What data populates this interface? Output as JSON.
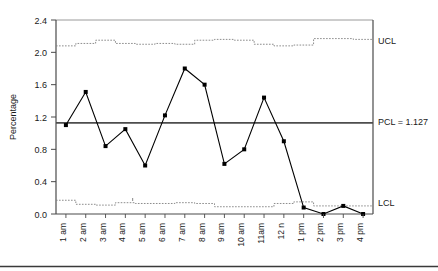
{
  "chart_data": {
    "type": "line",
    "title": "",
    "subtitle": "",
    "xlabel": "",
    "ylabel": "Percentage",
    "ylim": [
      0.0,
      2.4
    ],
    "yticks": [
      0.0,
      0.4,
      0.8,
      1.2,
      1.6,
      2.0,
      2.4
    ],
    "ytick_labels": [
      "0.0",
      "0.4",
      "0.8",
      "1.2",
      "1.6",
      "2.0",
      "2.4"
    ],
    "grid": false,
    "legend": "none",
    "categories": [
      "1 am",
      "2 am",
      "3 am",
      "4 am",
      "5 am",
      "6 am",
      "7 am",
      "8 am",
      "9 am",
      "10 am",
      "11am",
      "12 n",
      "1 pm",
      "2 pm",
      "3 pm",
      "4 pm"
    ],
    "series": [
      {
        "name": "Percentage",
        "marker": "filled-square",
        "color": "#000000",
        "values": [
          1.1,
          1.51,
          0.84,
          1.05,
          0.6,
          1.22,
          1.8,
          1.6,
          0.62,
          0.8,
          1.44,
          0.9,
          0.08,
          0.0,
          0.1,
          0.0
        ]
      },
      {
        "name": "UCL",
        "style": "dotted-step",
        "color": "#808080",
        "values": [
          2.08,
          2.11,
          2.15,
          2.11,
          2.1,
          2.11,
          2.1,
          2.15,
          2.16,
          2.15,
          2.1,
          2.08,
          2.09,
          2.17,
          2.17,
          2.16
        ]
      },
      {
        "name": "LCL",
        "style": "dotted-step",
        "color": "#808080",
        "values": [
          0.17,
          0.12,
          0.11,
          0.14,
          0.13,
          0.13,
          0.14,
          0.13,
          0.09,
          0.09,
          0.09,
          0.13,
          0.15,
          0.1,
          0.1,
          0.1
        ]
      },
      {
        "name": "PCL",
        "style": "solid-center",
        "color": "#4d4d4d",
        "value": 1.127
      }
    ],
    "annotations": [
      {
        "key": "ucl",
        "text": "UCL",
        "y": 2.1
      },
      {
        "key": "pcl",
        "text": "PCL = 1.127",
        "y": 1.127
      },
      {
        "key": "lcl",
        "text": "LCL",
        "y": 0.12
      }
    ]
  },
  "labels": {
    "y_axis_title": "Percentage",
    "ucl": "UCL",
    "pcl": "PCL = 1.127",
    "lcl": "LCL"
  }
}
